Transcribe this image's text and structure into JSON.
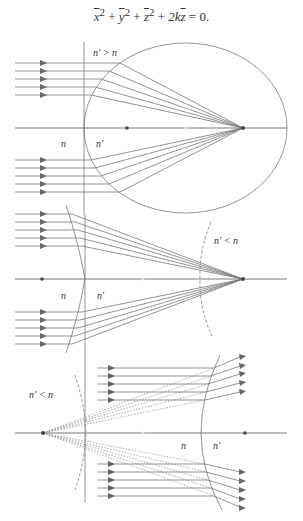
{
  "equation": {
    "terms": [
      "x",
      "y",
      "z"
    ],
    "text_parts": {
      "x": "x",
      "y": "y",
      "z": "z",
      "sq": "2",
      "plus": " + ",
      "two_k": "2k",
      "z_lin": "z",
      "equals_zero": " = 0."
    },
    "full": "x̄² + ȳ² + z̄² + 2kz̄ = 0."
  },
  "panels": [
    {
      "name": "ellipsoid-refraction",
      "label_condition": "n' > n",
      "label_left_medium": "n",
      "label_right_medium": "n'",
      "surface": "ellipse",
      "axis_y": 128,
      "incoming_rays_upper_y": [
        63,
        71,
        79,
        87,
        95
      ],
      "incoming_rays_lower_y": [
        160,
        168,
        176,
        184,
        192
      ],
      "focus_x": 243,
      "center_dot_x": 186,
      "vertex_dot_x": 127
    },
    {
      "name": "hyperboloid-refraction",
      "label_condition": "n' < n",
      "label_left_medium": "n",
      "label_right_medium": "n'",
      "surface": "hyperbola",
      "axis_y": 279,
      "incoming_rays_upper_y": [
        214,
        222,
        230,
        238,
        246
      ],
      "incoming_rays_lower_y": [
        312,
        320,
        328,
        336,
        344
      ],
      "focus_x": 243,
      "center_dot_x": 143,
      "left_dot_x": 42
    },
    {
      "name": "hyperboloid-virtual-focus",
      "label_condition": "n' < n",
      "label_left_medium": "n",
      "label_right_medium": "n'",
      "surface": "hyperbola",
      "axis_y": 433,
      "incoming_rays_upper_y": [
        368,
        376,
        384,
        392,
        400
      ],
      "incoming_rays_lower_y": [
        464,
        472,
        480,
        488,
        496
      ],
      "virtual_focus_x": 43,
      "center_dot_x": 143,
      "right_dot_x": 245
    }
  ],
  "colors": {
    "line": "#777777",
    "dark": "#444444",
    "light_dot": "#cccccc"
  }
}
